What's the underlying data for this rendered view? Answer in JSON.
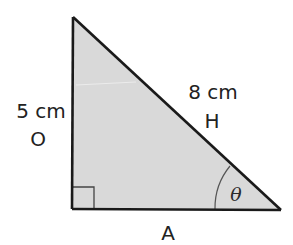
{
  "diagram": {
    "type": "right-triangle",
    "fill_color": "#d9d9d9",
    "stroke_color": "#1a1a1a",
    "vertices": {
      "top": [
        73,
        17
      ],
      "right_angle": [
        72,
        209
      ],
      "acute": [
        281,
        210
      ]
    },
    "right_angle_marker": "square",
    "angle_marker": {
      "at": "acute",
      "symbol": "θ"
    },
    "sides": {
      "opposite": {
        "length_label": "5 cm",
        "role_label": "O"
      },
      "hypotenuse": {
        "length_label": "8 cm",
        "role_label": "H"
      },
      "adjacent": {
        "role_label": "A"
      }
    }
  }
}
